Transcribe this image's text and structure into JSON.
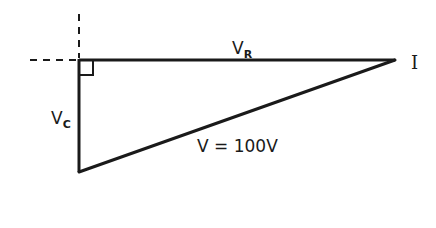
{
  "diagram": {
    "type": "phasor-voltage-triangle",
    "labels": {
      "vr_main": "V",
      "vr_sub": "R",
      "vc_main": "V",
      "vc_sub": "C",
      "current": "I",
      "total_voltage": "V = 100V"
    },
    "colors": {
      "line": "#1a1a1a",
      "background": "#ffffff"
    },
    "geometry": {
      "origin": [
        79,
        60
      ],
      "vr_end": [
        395,
        60
      ],
      "vc_end": [
        79,
        172
      ],
      "right_angle_marker": true
    }
  }
}
